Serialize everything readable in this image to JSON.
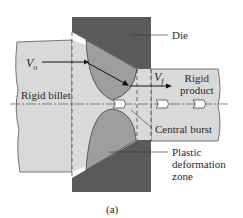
{
  "figure": {
    "caption": "(a)",
    "labels": {
      "die": "Die",
      "v_o": "V",
      "v_o_sub": "o",
      "v_f": "V",
      "v_f_sub": "f",
      "rigid_product_line1": "Rigid",
      "rigid_product_line2": "product",
      "rigid_billet": "Rigid billet",
      "central_burst": "Central burst",
      "plastic_line1": "Plastic",
      "plastic_line2": "deformation",
      "plastic_line3": "zone"
    },
    "colors": {
      "die": "#5a5a5a",
      "billet": "#d9d9d9",
      "plastic_zone": "#9e9e9e",
      "outline": "#333333"
    }
  }
}
